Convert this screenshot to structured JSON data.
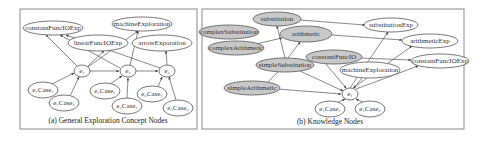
{
  "panels": [
    {
      "id": "a",
      "caption": "(a) General Exploration Concept Nodes",
      "nodes": [
        {
          "id": "constantFuncIOExp",
          "label": "constantFuncIOExp",
          "x": 53,
          "y": 28,
          "rx": 30,
          "ry": 7,
          "gray": false
        },
        {
          "id": "machineExploration",
          "label": "machineExploration",
          "x": 142,
          "y": 24,
          "rx": 30,
          "ry": 7,
          "gray": false
        },
        {
          "id": "linearFuncIOExp",
          "label": "linearFuncIOExp",
          "x": 98,
          "y": 43,
          "rx": 30,
          "ry": 8,
          "gray": false
        },
        {
          "id": "arrowExporation",
          "label": "arrowExporation",
          "x": 162,
          "y": 43,
          "rx": 30,
          "ry": 8,
          "gray": false
        },
        {
          "id": "e1",
          "label": "e₁",
          "x": 82,
          "y": 71,
          "rx": 8,
          "ry": 6,
          "gray": false
        },
        {
          "id": "e2",
          "label": "e₂",
          "x": 128,
          "y": 71,
          "rx": 8,
          "ry": 6,
          "gray": false
        },
        {
          "id": "e3",
          "label": "e₃",
          "x": 167,
          "y": 71,
          "rx": 8,
          "ry": 6,
          "gray": false
        },
        {
          "id": "e1case1",
          "label": "e₁Case₁",
          "x": 43,
          "y": 90,
          "rx": 15,
          "ry": 8,
          "gray": false
        },
        {
          "id": "e1case2",
          "label": "e₁Case₂",
          "x": 64,
          "y": 103,
          "rx": 15,
          "ry": 8,
          "gray": false
        },
        {
          "id": "e2case1",
          "label": "e₂Case₁",
          "x": 105,
          "y": 91,
          "rx": 15,
          "ry": 8,
          "gray": false
        },
        {
          "id": "e2case2",
          "label": "e₂Case₂",
          "x": 127,
          "y": 106,
          "rx": 15,
          "ry": 8,
          "gray": false
        },
        {
          "id": "e3case1",
          "label": "e₃Case₁",
          "x": 152,
          "y": 94,
          "rx": 15,
          "ry": 8,
          "gray": false
        },
        {
          "id": "e3case2",
          "label": "e₃Case₂",
          "x": 178,
          "y": 108,
          "rx": 15,
          "ry": 8,
          "gray": false
        }
      ]
    },
    {
      "id": "b",
      "caption": "(b) Knowledge Nodes",
      "nodes": [
        {
          "id": "substitution",
          "label": "substitution",
          "x": 277,
          "y": 19,
          "rx": 24,
          "ry": 7,
          "gray": true
        },
        {
          "id": "complexSubstitution",
          "label": "complexSubstitution",
          "x": 229,
          "y": 32,
          "rx": 30,
          "ry": 7,
          "gray": true
        },
        {
          "id": "arithmetic",
          "label": "arithmetic",
          "x": 306,
          "y": 34,
          "rx": 26,
          "ry": 8,
          "gray": true
        },
        {
          "id": "complexArithmetic",
          "label": "complexArithmetic",
          "x": 236,
          "y": 48,
          "rx": 28,
          "ry": 7,
          "gray": true
        },
        {
          "id": "constantFuncIO",
          "label": "constantFuncIO",
          "x": 334,
          "y": 57,
          "rx": 28,
          "ry": 7,
          "gray": true
        },
        {
          "id": "simpleSubstitution",
          "label": "simpleSubstitution",
          "x": 285,
          "y": 65,
          "rx": 29,
          "ry": 7,
          "gray": true
        },
        {
          "id": "simpleArithmetic",
          "label": "simpleArithmetic",
          "x": 252,
          "y": 88,
          "rx": 28,
          "ry": 7,
          "gray": true
        },
        {
          "id": "substitutionExp",
          "label": "substitutionExp",
          "x": 391,
          "y": 25,
          "rx": 27,
          "ry": 7,
          "gray": false
        },
        {
          "id": "arithmeticExp",
          "label": "arithmeticExp",
          "x": 430,
          "y": 41,
          "rx": 28,
          "ry": 7,
          "gray": false
        },
        {
          "id": "constantFuncIOExp_b",
          "label": "constantFuncIOExp",
          "x": 440,
          "y": 61,
          "rx": 29,
          "ry": 7,
          "gray": false
        },
        {
          "id": "machineExploration_b",
          "label": "machineExploration",
          "x": 370,
          "y": 70,
          "rx": 30,
          "ry": 8,
          "gray": false
        },
        {
          "id": "e1b",
          "label": "e₁",
          "x": 350,
          "y": 94,
          "rx": 8,
          "ry": 6,
          "gray": false
        },
        {
          "id": "e1bcase1",
          "label": "e₁Case₁",
          "x": 330,
          "y": 109,
          "rx": 15,
          "ry": 8,
          "gray": false
        },
        {
          "id": "e1bcase2",
          "label": "e₁Case₂",
          "x": 370,
          "y": 109,
          "rx": 15,
          "ry": 8,
          "gray": false
        }
      ]
    }
  ]
}
